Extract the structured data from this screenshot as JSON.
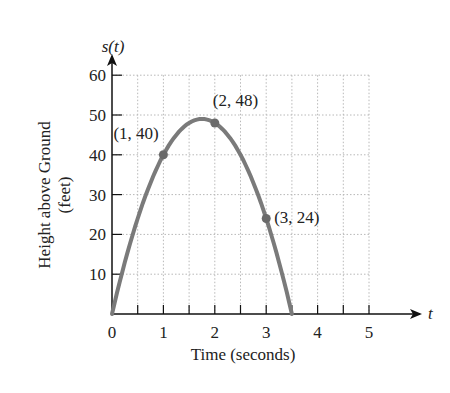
{
  "chart_data": {
    "type": "line",
    "title": "",
    "xlabel": "Time (seconds)",
    "ylabel": "Height above Ground (feet)",
    "ylabel_lines": [
      "Height above Ground",
      "(feet)"
    ],
    "x_axis_var": "t",
    "y_axis_var": "s(t)",
    "xlim": [
      0,
      5
    ],
    "ylim": [
      0,
      60
    ],
    "x_ticks": [
      0,
      1,
      2,
      3,
      4,
      5
    ],
    "y_ticks": [
      10,
      20,
      30,
      40,
      50,
      60
    ],
    "grid": true,
    "function": "s(t) = -16t^2 + 56t",
    "series": [
      {
        "name": "s(t)",
        "x": [
          0,
          0.5,
          1,
          1.5,
          1.75,
          2,
          2.5,
          3,
          3.5
        ],
        "values": [
          0,
          24,
          40,
          48,
          49,
          48,
          40,
          24,
          0
        ],
        "color": "#7a7a7a"
      }
    ],
    "points": [
      {
        "x": 1,
        "y": 40,
        "label": "(1, 40)"
      },
      {
        "x": 2,
        "y": 48,
        "label": "(2, 48)"
      },
      {
        "x": 3,
        "y": 24,
        "label": "(3, 24)"
      }
    ]
  }
}
